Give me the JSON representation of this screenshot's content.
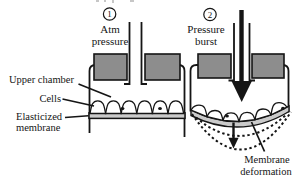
{
  "figure_type": "cell-stretch pressure chamber diagram",
  "colors": {
    "background": "#ffffff",
    "ink": "#151515",
    "block_fill": "#8d8d8d",
    "membrane_fill": "#cacaca",
    "cell_fill": "#ffffff"
  },
  "panel1": {
    "step": "1",
    "title_line1": "Atm",
    "title_line2": "pressure"
  },
  "panel2": {
    "step": "2",
    "title_line1": "Pressure",
    "title_line2": "burst"
  },
  "labels": {
    "upper_chamber": "Upper chamber",
    "cells": "Cells",
    "elasticized_membrane_line1": "Elasticized",
    "elasticized_membrane_line2": "membrane",
    "membrane_deformation_line1": "Membrane",
    "membrane_deformation_line2": "deformation"
  }
}
